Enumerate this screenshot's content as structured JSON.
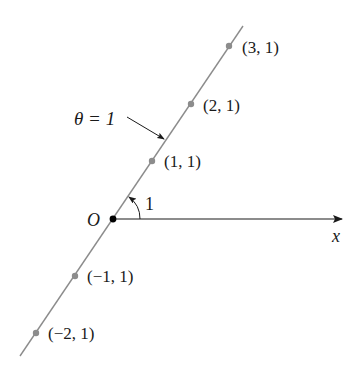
{
  "diagram": {
    "title_label": "θ = 1",
    "origin_label": "O",
    "axis_label": "x",
    "angle_label": "1",
    "points": [
      {
        "label": "(3, 1)",
        "r": 3,
        "theta": 1
      },
      {
        "label": "(2, 1)",
        "r": 2,
        "theta": 1
      },
      {
        "label": "(1, 1)",
        "r": 1,
        "theta": 1
      },
      {
        "label": "(−1, 1)",
        "r": -1,
        "theta": 1
      },
      {
        "label": "(−2, 1)",
        "r": -2,
        "theta": 1
      }
    ],
    "colors": {
      "line": "#8c8c8c",
      "points": "#8c8c8c",
      "axis": "#1a1a1a",
      "text": "#1a1a1a"
    }
  }
}
